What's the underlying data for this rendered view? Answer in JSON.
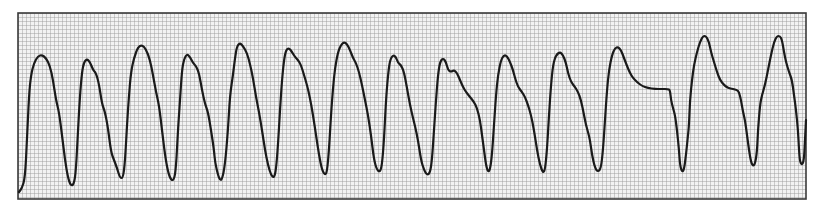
{
  "strip": {
    "type": "ecg-rhythm-strip",
    "frame": {
      "x": 18,
      "y": 13,
      "width": 788,
      "height": 186
    },
    "grid": {
      "cell_px": 4,
      "line_color": "#9a9a9a",
      "background": "#f2f2f2",
      "border_color": "#3a3a3a"
    },
    "trace": {
      "color": "#1a1a1a",
      "stroke_width": 2.2,
      "points": [
        [
          19,
          192
        ],
        [
          22,
          188
        ],
        [
          25,
          178
        ],
        [
          27,
          140
        ],
        [
          29,
          95
        ],
        [
          31,
          75
        ],
        [
          34,
          63
        ],
        [
          38,
          56
        ],
        [
          42,
          55
        ],
        [
          46,
          58
        ],
        [
          50,
          66
        ],
        [
          53,
          80
        ],
        [
          56,
          100
        ],
        [
          59,
          112
        ],
        [
          62,
          135
        ],
        [
          65,
          160
        ],
        [
          68,
          178
        ],
        [
          71,
          186
        ],
        [
          74,
          184
        ],
        [
          76,
          170
        ],
        [
          78,
          130
        ],
        [
          80,
          95
        ],
        [
          82,
          72
        ],
        [
          84,
          62
        ],
        [
          87,
          59
        ],
        [
          90,
          62
        ],
        [
          93,
          70
        ],
        [
          96,
          73
        ],
        [
          99,
          84
        ],
        [
          102,
          104
        ],
        [
          105,
          112
        ],
        [
          108,
          128
        ],
        [
          111,
          152
        ],
        [
          114,
          160
        ],
        [
          117,
          168
        ],
        [
          120,
          178
        ],
        [
          123,
          178
        ],
        [
          125,
          162
        ],
        [
          127,
          125
        ],
        [
          129,
          95
        ],
        [
          131,
          72
        ],
        [
          134,
          58
        ],
        [
          138,
          47
        ],
        [
          142,
          45
        ],
        [
          146,
          49
        ],
        [
          150,
          60
        ],
        [
          153,
          75
        ],
        [
          156,
          92
        ],
        [
          159,
          105
        ],
        [
          162,
          130
        ],
        [
          165,
          155
        ],
        [
          168,
          172
        ],
        [
          171,
          180
        ],
        [
          174,
          180
        ],
        [
          176,
          168
        ],
        [
          178,
          130
        ],
        [
          180,
          100
        ],
        [
          182,
          70
        ],
        [
          184,
          59
        ],
        [
          187,
          54
        ],
        [
          190,
          57
        ],
        [
          193,
          63
        ],
        [
          196,
          66
        ],
        [
          199,
          73
        ],
        [
          202,
          90
        ],
        [
          205,
          104
        ],
        [
          208,
          112
        ],
        [
          211,
          130
        ],
        [
          214,
          150
        ],
        [
          215,
          162
        ],
        [
          218,
          175
        ],
        [
          220,
          180
        ],
        [
          222,
          180
        ],
        [
          225,
          165
        ],
        [
          228,
          130
        ],
        [
          230,
          95
        ],
        [
          233,
          75
        ],
        [
          235,
          58
        ],
        [
          237,
          46
        ],
        [
          240,
          43
        ],
        [
          243,
          46
        ],
        [
          247,
          53
        ],
        [
          250,
          64
        ],
        [
          253,
          78
        ],
        [
          256,
          97
        ],
        [
          259,
          112
        ],
        [
          262,
          130
        ],
        [
          265,
          150
        ],
        [
          268,
          165
        ],
        [
          271,
          175
        ],
        [
          274,
          178
        ],
        [
          276,
          170
        ],
        [
          278,
          145
        ],
        [
          280,
          110
        ],
        [
          282,
          80
        ],
        [
          284,
          60
        ],
        [
          286,
          50
        ],
        [
          289,
          48
        ],
        [
          292,
          52
        ],
        [
          295,
          57
        ],
        [
          298,
          60
        ],
        [
          301,
          65
        ],
        [
          304,
          75
        ],
        [
          307,
          85
        ],
        [
          310,
          98
        ],
        [
          313,
          115
        ],
        [
          316,
          135
        ],
        [
          319,
          155
        ],
        [
          322,
          170
        ],
        [
          325,
          175
        ],
        [
          327,
          172
        ],
        [
          329,
          150
        ],
        [
          331,
          115
        ],
        [
          333,
          88
        ],
        [
          335,
          68
        ],
        [
          338,
          52
        ],
        [
          341,
          45
        ],
        [
          344,
          42
        ],
        [
          347,
          44
        ],
        [
          350,
          50
        ],
        [
          353,
          58
        ],
        [
          356,
          63
        ],
        [
          359,
          72
        ],
        [
          362,
          85
        ],
        [
          365,
          100
        ],
        [
          368,
          115
        ],
        [
          371,
          135
        ],
        [
          374,
          160
        ],
        [
          377,
          170
        ],
        [
          380,
          172
        ],
        [
          382,
          165
        ],
        [
          384,
          140
        ],
        [
          386,
          100
        ],
        [
          388,
          75
        ],
        [
          390,
          60
        ],
        [
          393,
          55
        ],
        [
          396,
          57
        ],
        [
          398,
          63
        ],
        [
          401,
          65
        ],
        [
          404,
          72
        ],
        [
          407,
          88
        ],
        [
          410,
          105
        ],
        [
          413,
          118
        ],
        [
          415,
          126
        ],
        [
          418,
          140
        ],
        [
          421,
          160
        ],
        [
          424,
          170
        ],
        [
          427,
          175
        ],
        [
          430,
          173
        ],
        [
          432,
          160
        ],
        [
          434,
          130
        ],
        [
          436,
          100
        ],
        [
          438,
          75
        ],
        [
          440,
          62
        ],
        [
          443,
          58
        ],
        [
          446,
          62
        ],
        [
          448,
          70
        ],
        [
          451,
          72
        ],
        [
          454,
          70
        ],
        [
          457,
          73
        ],
        [
          460,
          80
        ],
        [
          463,
          87
        ],
        [
          466,
          92
        ],
        [
          470,
          97
        ],
        [
          474,
          102
        ],
        [
          477,
          108
        ],
        [
          480,
          120
        ],
        [
          482,
          135
        ],
        [
          484,
          150
        ],
        [
          486,
          165
        ],
        [
          488,
          172
        ],
        [
          490,
          170
        ],
        [
          492,
          155
        ],
        [
          494,
          125
        ],
        [
          496,
          95
        ],
        [
          498,
          75
        ],
        [
          501,
          60
        ],
        [
          504,
          55
        ],
        [
          507,
          56
        ],
        [
          510,
          62
        ],
        [
          513,
          70
        ],
        [
          515,
          78
        ],
        [
          518,
          87
        ],
        [
          522,
          92
        ],
        [
          525,
          97
        ],
        [
          528,
          105
        ],
        [
          531,
          115
        ],
        [
          534,
          130
        ],
        [
          537,
          150
        ],
        [
          540,
          165
        ],
        [
          543,
          173
        ],
        [
          545,
          170
        ],
        [
          547,
          150
        ],
        [
          549,
          115
        ],
        [
          551,
          85
        ],
        [
          553,
          65
        ],
        [
          556,
          55
        ],
        [
          560,
          52
        ],
        [
          563,
          55
        ],
        [
          566,
          63
        ],
        [
          568,
          73
        ],
        [
          571,
          82
        ],
        [
          575,
          87
        ],
        [
          578,
          92
        ],
        [
          581,
          100
        ],
        [
          584,
          115
        ],
        [
          586,
          125
        ],
        [
          588,
          132
        ],
        [
          590,
          140
        ],
        [
          592,
          155
        ],
        [
          595,
          168
        ],
        [
          598,
          172
        ],
        [
          601,
          168
        ],
        [
          603,
          150
        ],
        [
          605,
          120
        ],
        [
          607,
          90
        ],
        [
          609,
          70
        ],
        [
          612,
          55
        ],
        [
          615,
          48
        ],
        [
          618,
          47
        ],
        [
          621,
          50
        ],
        [
          624,
          58
        ],
        [
          627,
          66
        ],
        [
          630,
          73
        ],
        [
          633,
          78
        ],
        [
          637,
          82
        ],
        [
          642,
          86
        ],
        [
          648,
          88
        ],
        [
          655,
          89
        ],
        [
          662,
          89
        ],
        [
          668,
          89
        ],
        [
          670,
          90
        ],
        [
          671,
          100
        ],
        [
          673,
          108
        ],
        [
          675,
          115
        ],
        [
          677,
          130
        ],
        [
          679,
          150
        ],
        [
          680,
          165
        ],
        [
          682,
          172
        ],
        [
          684,
          170
        ],
        [
          686,
          155
        ],
        [
          688,
          135
        ],
        [
          689,
          125
        ],
        [
          690,
          100
        ],
        [
          692,
          80
        ],
        [
          694,
          65
        ],
        [
          697,
          52
        ],
        [
          700,
          42
        ],
        [
          703,
          36
        ],
        [
          706,
          36
        ],
        [
          709,
          42
        ],
        [
          711,
          52
        ],
        [
          714,
          62
        ],
        [
          717,
          72
        ],
        [
          720,
          80
        ],
        [
          724,
          85
        ],
        [
          728,
          88
        ],
        [
          733,
          89
        ],
        [
          737,
          90
        ],
        [
          739,
          92
        ],
        [
          741,
          100
        ],
        [
          743,
          112
        ],
        [
          745,
          120
        ],
        [
          747,
          135
        ],
        [
          749,
          150
        ],
        [
          751,
          162
        ],
        [
          753,
          166
        ],
        [
          755,
          164
        ],
        [
          757,
          152
        ],
        [
          758,
          130
        ],
        [
          760,
          105
        ],
        [
          762,
          95
        ],
        [
          765,
          85
        ],
        [
          768,
          70
        ],
        [
          771,
          55
        ],
        [
          774,
          42
        ],
        [
          777,
          36
        ],
        [
          780,
          36
        ],
        [
          782,
          40
        ],
        [
          784,
          52
        ],
        [
          786,
          62
        ],
        [
          789,
          72
        ],
        [
          792,
          80
        ],
        [
          794,
          95
        ],
        [
          796,
          110
        ],
        [
          798,
          130
        ],
        [
          799,
          150
        ],
        [
          800,
          162
        ],
        [
          802,
          165
        ],
        [
          804,
          160
        ],
        [
          805,
          140
        ],
        [
          806,
          120
        ]
      ]
    }
  }
}
